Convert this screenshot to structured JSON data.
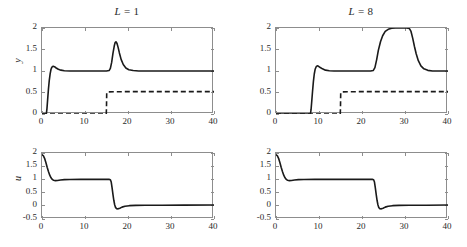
{
  "figure": {
    "width": 467,
    "height": 247,
    "background": "#ffffff",
    "line_color": "#1a1a1a",
    "axis_color": "#8d8d8d"
  },
  "chart_data": [
    {
      "id": "panel-top-left",
      "type": "line",
      "title": "L = 1",
      "title_variable": "L",
      "title_value": "1",
      "xlabel": "",
      "ylabel": "y",
      "xlim": [
        0,
        40
      ],
      "ylim": [
        0,
        2
      ],
      "xticks": [
        0,
        10,
        20,
        30,
        40
      ],
      "xticklabels": [
        "0",
        "10",
        "20",
        "30",
        "40"
      ],
      "yticks": [
        0,
        0.5,
        1,
        1.5,
        2
      ],
      "yticklabels": [
        "0",
        "0.5",
        "1",
        "1.5",
        "2"
      ],
      "grid": false,
      "legend": "none",
      "series": [
        {
          "name": "output y",
          "style": "solid",
          "points": [
            [
              0,
              0
            ],
            [
              1.0,
              0
            ],
            [
              1.15,
              0.12
            ],
            [
              1.3,
              0.32
            ],
            [
              1.5,
              0.58
            ],
            [
              1.7,
              0.79
            ],
            [
              1.9,
              0.94
            ],
            [
              2.1,
              1.04
            ],
            [
              2.3,
              1.09
            ],
            [
              2.6,
              1.11
            ],
            [
              2.9,
              1.1
            ],
            [
              3.3,
              1.07
            ],
            [
              3.8,
              1.04
            ],
            [
              4.4,
              1.02
            ],
            [
              5.2,
              1.005
            ],
            [
              6.5,
              1.0
            ],
            [
              9,
              1.0
            ],
            [
              12,
              1.0
            ],
            [
              15.0,
              1.0
            ],
            [
              15.6,
              1.01
            ],
            [
              15.9,
              1.06
            ],
            [
              16.2,
              1.2
            ],
            [
              16.5,
              1.41
            ],
            [
              16.8,
              1.58
            ],
            [
              17.0,
              1.66
            ],
            [
              17.2,
              1.68
            ],
            [
              17.45,
              1.64
            ],
            [
              17.7,
              1.55
            ],
            [
              18.0,
              1.42
            ],
            [
              18.4,
              1.27
            ],
            [
              18.9,
              1.15
            ],
            [
              19.5,
              1.07
            ],
            [
              20.2,
              1.03
            ],
            [
              21.2,
              1.01
            ],
            [
              22.5,
              1.0
            ],
            [
              25,
              1.0
            ],
            [
              30,
              1.0
            ],
            [
              35,
              1.0
            ],
            [
              40,
              1.0
            ]
          ]
        },
        {
          "name": "disturbance estimate",
          "style": "dashed",
          "points": [
            [
              0,
              0
            ],
            [
              14.95,
              0
            ],
            [
              15.0,
              0.18
            ],
            [
              15.05,
              0.5
            ],
            [
              15.4,
              0.515
            ],
            [
              17,
              0.518
            ],
            [
              20,
              0.52
            ],
            [
              25,
              0.52
            ],
            [
              30,
              0.52
            ],
            [
              35,
              0.52
            ],
            [
              40,
              0.52
            ]
          ]
        }
      ]
    },
    {
      "id": "panel-top-right",
      "type": "line",
      "title": "L = 8",
      "title_variable": "L",
      "title_value": "8",
      "xlabel": "",
      "ylabel": "",
      "xlim": [
        0,
        40
      ],
      "ylim": [
        0,
        2
      ],
      "xticks": [
        0,
        10,
        20,
        30,
        40
      ],
      "xticklabels": [
        "0",
        "10",
        "20",
        "30",
        "40"
      ],
      "yticks": [
        0,
        0.5,
        1,
        1.5,
        2
      ],
      "yticklabels": [
        "0",
        "0.5",
        "1",
        "1.5",
        "2"
      ],
      "grid": false,
      "legend": "none",
      "series": [
        {
          "name": "output y",
          "style": "solid",
          "points": [
            [
              0,
              0
            ],
            [
              8.0,
              0
            ],
            [
              8.15,
              0.1
            ],
            [
              8.3,
              0.28
            ],
            [
              8.5,
              0.53
            ],
            [
              8.7,
              0.76
            ],
            [
              8.9,
              0.93
            ],
            [
              9.1,
              1.04
            ],
            [
              9.35,
              1.1
            ],
            [
              9.6,
              1.12
            ],
            [
              9.9,
              1.11
            ],
            [
              10.3,
              1.08
            ],
            [
              10.8,
              1.05
            ],
            [
              11.5,
              1.02
            ],
            [
              12.4,
              1.005
            ],
            [
              13.5,
              1.0
            ],
            [
              16,
              1.0
            ],
            [
              19,
              1.0
            ],
            [
              22.0,
              1.0
            ],
            [
              22.6,
              1.01
            ],
            [
              23.0,
              1.08
            ],
            [
              23.4,
              1.26
            ],
            [
              23.8,
              1.48
            ],
            [
              24.3,
              1.68
            ],
            [
              24.8,
              1.82
            ],
            [
              25.4,
              1.92
            ],
            [
              26.1,
              1.97
            ],
            [
              26.9,
              1.995
            ],
            [
              27.8,
              2.0
            ],
            [
              29,
              2.0
            ],
            [
              30.4,
              2.0
            ],
            [
              31.0,
              1.99
            ],
            [
              31.4,
              1.92
            ],
            [
              31.8,
              1.76
            ],
            [
              32.2,
              1.57
            ],
            [
              32.6,
              1.4
            ],
            [
              33.1,
              1.24
            ],
            [
              33.7,
              1.12
            ],
            [
              34.4,
              1.05
            ],
            [
              35.3,
              1.015
            ],
            [
              36.4,
              1.0
            ],
            [
              38,
              1.0
            ],
            [
              40,
              1.0
            ]
          ]
        },
        {
          "name": "disturbance estimate",
          "style": "dashed",
          "points": [
            [
              0,
              0
            ],
            [
              14.95,
              0
            ],
            [
              15.0,
              0.18
            ],
            [
              15.05,
              0.5
            ],
            [
              15.4,
              0.515
            ],
            [
              17,
              0.518
            ],
            [
              20,
              0.52
            ],
            [
              25,
              0.52
            ],
            [
              30,
              0.52
            ],
            [
              35,
              0.52
            ],
            [
              40,
              0.52
            ]
          ]
        }
      ]
    },
    {
      "id": "panel-bottom-left",
      "type": "line",
      "title": "",
      "xlabel": "",
      "ylabel": "u",
      "xlim": [
        0,
        40
      ],
      "ylim": [
        -0.5,
        2
      ],
      "xticks": [
        0,
        10,
        20,
        30,
        40
      ],
      "xticklabels": [
        "0",
        "10",
        "20",
        "30",
        "40"
      ],
      "yticks": [
        -0.5,
        0,
        0.5,
        1,
        1.5,
        2
      ],
      "yticklabels": [
        "-0.5",
        "0",
        "0.5",
        "1",
        "1.5",
        "2"
      ],
      "grid": false,
      "legend": "none",
      "series": [
        {
          "name": "control u",
          "style": "solid",
          "points": [
            [
              0,
              1.93
            ],
            [
              0.3,
              1.9
            ],
            [
              0.6,
              1.8
            ],
            [
              0.9,
              1.64
            ],
            [
              1.2,
              1.46
            ],
            [
              1.5,
              1.3
            ],
            [
              1.8,
              1.16
            ],
            [
              2.1,
              1.06
            ],
            [
              2.4,
              1.0
            ],
            [
              2.7,
              0.965
            ],
            [
              3.1,
              0.955
            ],
            [
              3.6,
              0.96
            ],
            [
              4.3,
              0.975
            ],
            [
              5.2,
              0.99
            ],
            [
              6.5,
              0.998
            ],
            [
              9,
              1.0
            ],
            [
              12,
              1.0
            ],
            [
              15.6,
              1.0
            ],
            [
              15.9,
              0.99
            ],
            [
              16.1,
              0.9
            ],
            [
              16.3,
              0.68
            ],
            [
              16.5,
              0.43
            ],
            [
              16.7,
              0.21
            ],
            [
              16.9,
              0.04
            ],
            [
              17.1,
              -0.06
            ],
            [
              17.35,
              -0.11
            ],
            [
              17.7,
              -0.115
            ],
            [
              18.1,
              -0.09
            ],
            [
              18.6,
              -0.05
            ],
            [
              19.3,
              -0.015
            ],
            [
              20.3,
              0.005
            ],
            [
              21.8,
              0.015
            ],
            [
              24,
              0.02
            ],
            [
              28,
              0.02
            ],
            [
              33,
              0.025
            ],
            [
              40,
              0.03
            ]
          ]
        }
      ]
    },
    {
      "id": "panel-bottom-right",
      "type": "line",
      "title": "",
      "xlabel": "",
      "ylabel": "",
      "xlim": [
        0,
        40
      ],
      "ylim": [
        -0.5,
        2
      ],
      "xticks": [
        0,
        10,
        20,
        30,
        40
      ],
      "xticklabels": [
        "0",
        "10",
        "20",
        "30",
        "40"
      ],
      "yticks": [
        -0.5,
        0,
        0.5,
        1,
        1.5,
        2
      ],
      "yticklabels": [
        "-0.5",
        "0",
        "0.5",
        "1",
        "1.5",
        "2"
      ],
      "grid": false,
      "legend": "none",
      "series": [
        {
          "name": "control u",
          "style": "solid",
          "points": [
            [
              0,
              1.93
            ],
            [
              0.3,
              1.9
            ],
            [
              0.6,
              1.8
            ],
            [
              0.9,
              1.64
            ],
            [
              1.2,
              1.46
            ],
            [
              1.5,
              1.3
            ],
            [
              1.8,
              1.16
            ],
            [
              2.1,
              1.06
            ],
            [
              2.4,
              1.0
            ],
            [
              2.7,
              0.965
            ],
            [
              3.1,
              0.955
            ],
            [
              3.6,
              0.96
            ],
            [
              4.3,
              0.975
            ],
            [
              5.2,
              0.99
            ],
            [
              6.5,
              0.998
            ],
            [
              9,
              1.0
            ],
            [
              13,
              1.0
            ],
            [
              18,
              1.0
            ],
            [
              22.4,
              1.0
            ],
            [
              22.7,
              0.99
            ],
            [
              22.9,
              0.9
            ],
            [
              23.1,
              0.68
            ],
            [
              23.3,
              0.43
            ],
            [
              23.5,
              0.21
            ],
            [
              23.7,
              0.04
            ],
            [
              23.9,
              -0.06
            ],
            [
              24.15,
              -0.11
            ],
            [
              24.5,
              -0.115
            ],
            [
              24.9,
              -0.09
            ],
            [
              25.4,
              -0.05
            ],
            [
              26.1,
              -0.015
            ],
            [
              27.1,
              0.005
            ],
            [
              28.6,
              0.015
            ],
            [
              31,
              0.02
            ],
            [
              35,
              0.02
            ],
            [
              40,
              0.03
            ]
          ]
        }
      ]
    }
  ]
}
